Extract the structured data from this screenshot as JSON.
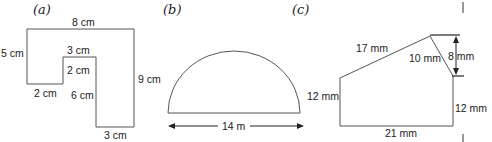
{
  "figures": [
    {
      "id": "a",
      "panel_label": "(a)",
      "shape": "L-shaped rectilinear polygon",
      "labels": {
        "top": "8 cm",
        "left": "5 cm",
        "inner_top": "3 cm",
        "inner_step": "2 cm",
        "bottom_left": "2 cm",
        "inner_vertical": "6 cm",
        "right": "9 cm",
        "bottom": "3 cm"
      }
    },
    {
      "id": "b",
      "panel_label": "(b)",
      "shape": "semicircle",
      "labels": {
        "diameter": "14 m"
      }
    },
    {
      "id": "c",
      "panel_label": "(c)",
      "shape": "pentagon",
      "labels": {
        "slant_long": "17 mm",
        "slant_short": "10 mm",
        "vertical_drop": "8 mm",
        "left": "12 mm",
        "right": "12 mm",
        "bottom": "21 mm"
      }
    }
  ],
  "colors": {
    "line": "#555555",
    "text": "#222222",
    "background": "#ffffff"
  }
}
